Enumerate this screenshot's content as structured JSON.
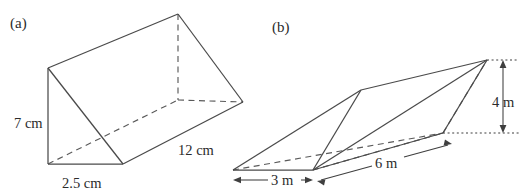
{
  "page": {
    "background_color": "#ffffff",
    "ink_color": "#4a4a4a",
    "width": 526,
    "height": 195
  },
  "figures": [
    {
      "id": "figure-a",
      "part_label": "(a)",
      "shape_name": "triangular-prism",
      "unit": "cm",
      "dimensions": [
        {
          "name": "height",
          "label": "7 cm",
          "value": 7,
          "unit": "cm"
        },
        {
          "name": "base-width",
          "label": "2.5 cm",
          "value": 2.5,
          "unit": "cm"
        },
        {
          "name": "length",
          "label": "12 cm",
          "value": 12,
          "unit": "cm"
        }
      ]
    },
    {
      "id": "figure-b",
      "part_label": "(b)",
      "shape_name": "oblique-triangular-prism",
      "unit": "m",
      "dimensions": [
        {
          "name": "vertical-height",
          "label": "4 m",
          "value": 4,
          "unit": "m"
        },
        {
          "name": "base-width",
          "label": "3 m",
          "value": 3,
          "unit": "m"
        },
        {
          "name": "length",
          "label": "6 m",
          "value": 6,
          "unit": "m"
        }
      ]
    }
  ],
  "labels": {
    "part_a": "(a)",
    "part_b": "(b)",
    "a_height": "7 cm",
    "a_base": "2.5 cm",
    "a_length": "12 cm",
    "b_height": "4 m",
    "b_base": "3 m",
    "b_length": "6 m"
  }
}
